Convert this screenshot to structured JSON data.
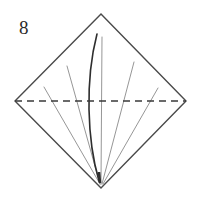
{
  "figure": {
    "step_number": "8",
    "caption": "",
    "background_color": "#ffffff"
  },
  "colors": {
    "outline": "#4a4a4a",
    "fold_dashed": "#3a3a3a",
    "thin_crease": "#8a8a8a",
    "emphasis_curve": "#2e2e2e",
    "label_text": "#2b2b2b"
  },
  "shapes": {
    "diamond": {
      "name": "square-rotated-45",
      "top": [
        101,
        14
      ],
      "right": [
        186,
        101
      ],
      "bottom": [
        101,
        188
      ],
      "left": [
        15,
        101
      ],
      "stroke_width": 1.4
    },
    "dashed_fold_line": {
      "from": [
        15,
        101
      ],
      "to": [
        186,
        101
      ],
      "dash_pattern": "7 5",
      "stroke_width": 1.3
    },
    "creases": [
      {
        "name": "crease-outer-left",
        "from": [
          44,
          87
        ],
        "to": [
          100,
          184
        ],
        "stroke_width": 0.9
      },
      {
        "name": "crease-inner-left",
        "from": [
          67,
          66
        ],
        "to": [
          100,
          184
        ],
        "stroke_width": 0.9
      },
      {
        "name": "crease-center-vertical",
        "from": [
          102,
          37
        ],
        "to": [
          101,
          184
        ],
        "stroke_width": 0.9
      },
      {
        "name": "crease-inner-right",
        "from": [
          134,
          62
        ],
        "to": [
          102,
          184
        ],
        "stroke_width": 0.9
      },
      {
        "name": "crease-outer-right",
        "from": [
          158,
          88
        ],
        "to": [
          103,
          184
        ],
        "stroke_width": 0.9
      }
    ],
    "emphasis_curve": {
      "name": "emphasized-fold-curve",
      "start": [
        97,
        34
      ],
      "control_1": [
        85,
        80
      ],
      "control_2": [
        87,
        140
      ],
      "end": [
        99,
        181
      ],
      "stroke_width": 1.6
    },
    "emphasis_curve_tail": {
      "name": "emphasized-curve-tail",
      "from": [
        99,
        172
      ],
      "to": [
        100,
        183
      ],
      "stroke_width": 2.6
    }
  }
}
